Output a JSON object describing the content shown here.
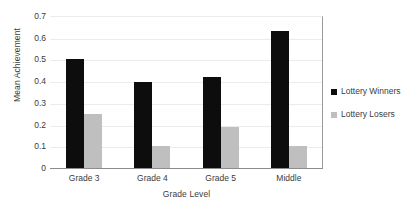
{
  "chart_data": {
    "type": "bar",
    "title": "",
    "subtitle": "",
    "xlabel": "Grade Level",
    "ylabel": "Mean Achievement",
    "categories": [
      "Grade 3",
      "Grade 4",
      "Grade 5",
      "Middle"
    ],
    "series": [
      {
        "name": "Lottery Winners",
        "color": "#0d0d0d",
        "values": [
          0.5,
          0.395,
          0.42,
          0.63
        ]
      },
      {
        "name": "Lottery Losers",
        "color": "#bfbfbf",
        "values": [
          0.25,
          0.1,
          0.19,
          0.1
        ]
      }
    ],
    "ylim": [
      0,
      0.7
    ],
    "y_ticks": [
      "0",
      "0.1",
      "0.2",
      "0.3",
      "0.4",
      "0.5",
      "0.6",
      "0.7"
    ],
    "y_tick_values": [
      0,
      0.1,
      0.2,
      0.3,
      0.4,
      0.5,
      0.6,
      0.7
    ],
    "grid": true,
    "grid_axis": "y",
    "grid_color": "#ececec",
    "legend_position": "right",
    "axis_line_color": "#8c8c8c",
    "text_color": "#3b3b3b",
    "background": "#ffffff"
  },
  "legend": {
    "items": [
      {
        "label": "Lottery Winners",
        "swatch": "legend-swatch-black"
      },
      {
        "label": "Lottery Losers",
        "swatch": "legend-swatch-gray"
      }
    ]
  }
}
